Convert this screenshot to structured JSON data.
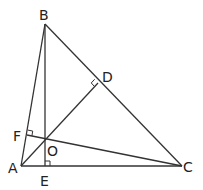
{
  "figure": {
    "points": {
      "A": {
        "label": "A",
        "x": 21,
        "y": 166,
        "lx": 8,
        "ly": 173
      },
      "B": {
        "label": "B",
        "x": 45,
        "y": 24,
        "lx": 39,
        "ly": 20
      },
      "C": {
        "label": "C",
        "x": 182,
        "y": 166,
        "lx": 183,
        "ly": 172
      },
      "D": {
        "label": "D",
        "x": 98,
        "y": 83,
        "lx": 102,
        "ly": 82
      },
      "E": {
        "label": "E",
        "x": 45,
        "y": 166,
        "lx": 40,
        "ly": 186
      },
      "F": {
        "label": "F",
        "x": 27,
        "y": 135,
        "lx": 13,
        "ly": 141
      },
      "O": {
        "label": "O",
        "x": 45,
        "y": 142,
        "lx": 47,
        "ly": 156
      }
    },
    "segments": [
      {
        "name": "side-ab",
        "from": "A",
        "to": "B"
      },
      {
        "name": "side-bc",
        "from": "B",
        "to": "C"
      },
      {
        "name": "side-ac",
        "from": "A",
        "to": "C"
      },
      {
        "name": "altitude-be",
        "from": "B",
        "to": "E"
      },
      {
        "name": "altitude-ad",
        "from": "A",
        "to": "D"
      },
      {
        "name": "altitude-cf",
        "from": "C",
        "to": "F"
      }
    ],
    "right_angle_marks": [
      "D",
      "E",
      "F"
    ],
    "colors": {
      "stroke": "#333333",
      "text": "#222222",
      "background": "#ffffff"
    }
  }
}
